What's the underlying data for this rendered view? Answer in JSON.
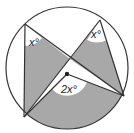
{
  "diagram": {
    "title": "",
    "labels": {
      "angle_a": "x°",
      "angle_b": "x°",
      "angle_center": "2x°"
    },
    "colors": {
      "shade": "#a8a8a8",
      "line": "#333333",
      "background": "#ffffff"
    }
  }
}
